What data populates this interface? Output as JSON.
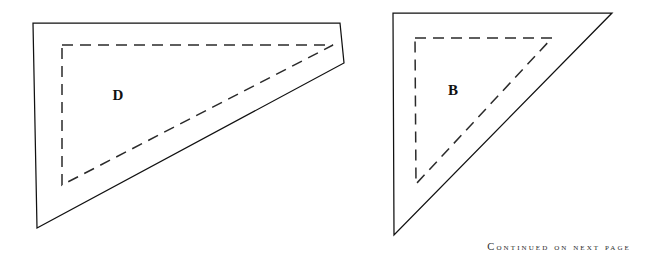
{
  "page": {
    "background_color": "#ffffff",
    "width": 645,
    "height": 263
  },
  "figures": [
    {
      "id": "figure-d",
      "label": "D",
      "label_position": {
        "x": 118,
        "y": 97
      },
      "solid_shape": {
        "name": "solid-quadrilateral-d",
        "stroke_color": "#111111",
        "stroke_width": 1.25,
        "points": "33,23 340,23 344,63 37,228"
      },
      "dashed_shape": {
        "name": "dashed-triangle-d",
        "stroke_color": "#2a2a2a",
        "stroke_width": 1.5,
        "dash_pattern": "11 7",
        "points": "62,45 333,45 62,185"
      }
    },
    {
      "id": "figure-b",
      "label": "B",
      "label_position": {
        "x": 453,
        "y": 92
      },
      "solid_shape": {
        "name": "solid-triangle-b",
        "stroke_color": "#111111",
        "stroke_width": 1.25,
        "points": "393,13 612,13 394,235"
      },
      "dashed_shape": {
        "name": "dashed-triangle-b",
        "stroke_color": "#2a2a2a",
        "stroke_width": 1.5,
        "dash_pattern": "11 7",
        "points": "415,38 552,38 416,184"
      }
    }
  ],
  "footer": {
    "continued_text": "Continued on next page"
  }
}
